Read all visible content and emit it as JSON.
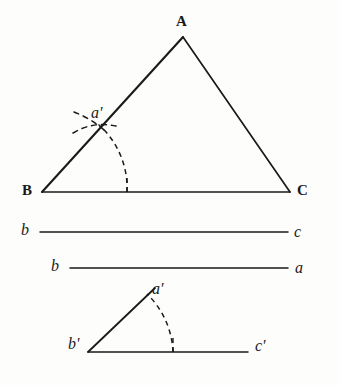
{
  "figure": {
    "background_color": "#fdfdfc",
    "ink_color": "#1a1a1a",
    "upper_triangle": {
      "name": "triangle-ABC",
      "vertex_apex_label": "A",
      "vertex_left_label": "B",
      "vertex_right_label": "C",
      "intersection_label": "a'",
      "apex": {
        "x": 183,
        "y": 37
      },
      "left": {
        "x": 42,
        "y": 192
      },
      "right": {
        "x": 290,
        "y": 192
      },
      "arc_center": {
        "x": 42,
        "y": 192
      },
      "arc_radius": 85,
      "arc_foot": {
        "x": 127,
        "y": 192
      },
      "arc_cross": {
        "x": 100,
        "y": 122
      }
    },
    "segment_bc": {
      "name": "segment-b-c",
      "left_label": "b",
      "right_label": "c",
      "x1": 40,
      "x2": 288,
      "y": 232
    },
    "segment_ba": {
      "name": "segment-b-a",
      "left_label": "b",
      "right_label": "a",
      "x1": 70,
      "x2": 288,
      "y": 268
    },
    "lower_triangle": {
      "name": "angle-b-prime",
      "vertex_apex_label": "a'",
      "vertex_left_label": "b'",
      "vertex_right_label": "c'",
      "apex": {
        "x": 155,
        "y": 288
      },
      "left": {
        "x": 88,
        "y": 352
      },
      "right": {
        "x": 248,
        "y": 352
      },
      "arc_center": {
        "x": 88,
        "y": 352
      },
      "arc_radius": 85,
      "arc_foot": {
        "x": 173,
        "y": 352
      }
    },
    "labels": [
      {
        "name": "label-A",
        "text": "A",
        "style": "cap",
        "x": 176,
        "y": 14
      },
      {
        "name": "label-B",
        "text": "B",
        "style": "cap",
        "x": 22,
        "y": 183
      },
      {
        "name": "label-C",
        "text": "C",
        "style": "cap",
        "x": 297,
        "y": 183
      },
      {
        "name": "label-a-prime-upper",
        "text": "a'",
        "style": "ital",
        "x": 91,
        "y": 105
      },
      {
        "name": "label-b-left-1",
        "text": "b",
        "style": "ital",
        "x": 21,
        "y": 222
      },
      {
        "name": "label-c-right-1",
        "text": "c",
        "style": "ital",
        "x": 294,
        "y": 224
      },
      {
        "name": "label-b-left-2",
        "text": "b",
        "style": "ital",
        "x": 51,
        "y": 258
      },
      {
        "name": "label-a-right-2",
        "text": "a",
        "style": "ital",
        "x": 295,
        "y": 260
      },
      {
        "name": "label-a-prime-lower",
        "text": "a'",
        "style": "ital",
        "x": 152,
        "y": 281
      },
      {
        "name": "label-b-prime",
        "text": "b'",
        "style": "ital",
        "x": 68,
        "y": 336
      },
      {
        "name": "label-c-prime",
        "text": "c'",
        "style": "ital",
        "x": 255,
        "y": 338
      }
    ]
  }
}
